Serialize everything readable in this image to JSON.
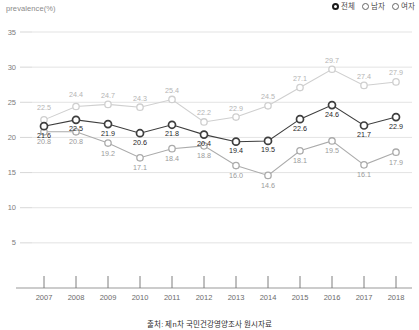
{
  "axis_unit_label": "prevalence(%)",
  "legend": {
    "position": "top-right",
    "items": [
      {
        "label": "전체",
        "selected": true,
        "color": "#3d3d3d",
        "marker": "radio-filled-icon"
      },
      {
        "label": "남자",
        "selected": false,
        "color": "#c9c9c9",
        "marker": "radio-icon"
      },
      {
        "label": "여자",
        "selected": false,
        "color": "#a6a6a6",
        "marker": "radio-icon"
      }
    ]
  },
  "caption": "출처: 제n차 국민건강영양조사 원시자료",
  "chart_data": {
    "type": "line",
    "title": "",
    "subtitle": "",
    "xlabel": "",
    "ylabel": "prevalence(%)",
    "grid": true,
    "legend_position": "top-right",
    "ylim": [
      0,
      35
    ],
    "yticks": [
      5,
      10,
      15,
      20,
      25,
      30,
      35
    ],
    "categories": [
      "2007",
      "2008",
      "2009",
      "2010",
      "2011",
      "2012",
      "2013",
      "2014",
      "2015",
      "2016",
      "2017",
      "2018"
    ],
    "x": [
      2007,
      2008,
      2009,
      2010,
      2011,
      2012,
      2013,
      2014,
      2015,
      2016,
      2017,
      2018
    ],
    "series": [
      {
        "name": "전체",
        "color": "#3d3d3d",
        "label_color": "#1f1f1f",
        "values": [
          21.6,
          22.5,
          21.9,
          20.6,
          21.8,
          20.4,
          19.4,
          19.5,
          22.6,
          24.6,
          21.7,
          22.9
        ]
      },
      {
        "name": "남자",
        "color": "#cfcfcf",
        "label_color": "#b4b4b4",
        "values": [
          22.5,
          24.4,
          24.7,
          24.3,
          25.4,
          22.2,
          22.9,
          24.5,
          27.1,
          29.7,
          27.4,
          27.9
        ]
      },
      {
        "name": "여자",
        "color": "#ababab",
        "label_color": "#9b9b9b",
        "values": [
          20.8,
          20.8,
          19.2,
          17.1,
          18.4,
          18.8,
          16.0,
          14.6,
          18.1,
          19.5,
          16.1,
          17.9
        ]
      }
    ]
  }
}
